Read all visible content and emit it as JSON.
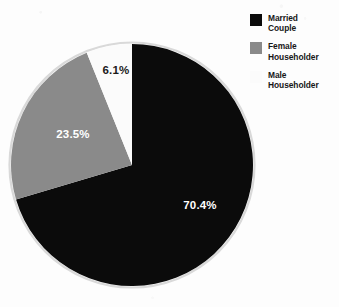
{
  "chart_data": {
    "type": "pie",
    "title": "",
    "subtitle": "",
    "xlabel": "",
    "ylabel": "",
    "grid": false,
    "legend_position": "top-right",
    "start_angle_deg": 0,
    "direction": "clockwise",
    "categories": [
      "Married Couple",
      "Female Householder",
      "Male Householder"
    ],
    "values": [
      70.4,
      23.5,
      6.1
    ],
    "value_unit": "percent",
    "data_labels": [
      "70.4%",
      "23.5%",
      "6.1%"
    ],
    "colors": [
      "#0b0b0b",
      "#8a8a8a",
      "#fbfbfb"
    ],
    "slices": [
      {
        "label": "Married Couple",
        "value": 70.4,
        "data_label": "70.4%",
        "color": "#0b0b0b",
        "label_color": "#ffffff"
      },
      {
        "label": "Female Householder",
        "value": 23.5,
        "data_label": "23.5%",
        "color": "#8a8a8a",
        "label_color": "#ffffff"
      },
      {
        "label": "Male Householder",
        "value": 6.1,
        "data_label": "6.1%",
        "color": "#fbfbfb",
        "label_color": "#1a1a1a"
      }
    ]
  },
  "legend": {
    "items": [
      {
        "swatch": "black-swatch",
        "line1": "Married",
        "line2": "Couple",
        "color": "#0b0b0b"
      },
      {
        "swatch": "gray-swatch",
        "line1": "Female",
        "line2": "Householder",
        "color": "#8a8a8a"
      },
      {
        "swatch": "white-swatch",
        "line1": "Male",
        "line2": "Householder",
        "color": "#fbfbfb"
      }
    ]
  }
}
